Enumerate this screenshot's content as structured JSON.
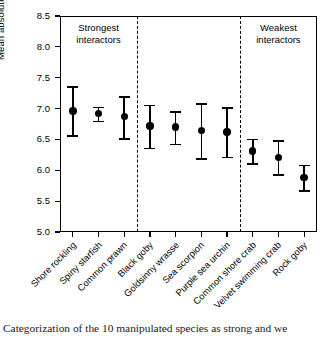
{
  "chart_data": {
    "type": "scatter",
    "title": "",
    "xlabel": "",
    "ylabel": "Mean absolute net effect (×10",
    "ylabel_exponent": "-3",
    "ylabel_close": ")",
    "ylim": [
      5.0,
      8.5
    ],
    "yticks": [
      "5.0",
      "5.5",
      "6.0",
      "6.5",
      "7.0",
      "7.5",
      "8.0",
      "8.5"
    ],
    "ytick_values": [
      5.0,
      5.5,
      6.0,
      6.5,
      7.0,
      7.5,
      8.0,
      8.5
    ],
    "grid": false,
    "legend": "none",
    "categories": [
      "Shore rockling",
      "Spiny starfish",
      "Common prawn",
      "Black goby",
      "Goldsinny wrasse",
      "Sea scorpion",
      "Purple sea urchin",
      "Common shore crab",
      "Velvet swimming crab",
      "Rock goby"
    ],
    "values": [
      6.96,
      6.92,
      6.87,
      6.72,
      6.7,
      6.64,
      6.62,
      6.31,
      6.21,
      5.88
    ],
    "error_low": [
      6.56,
      6.79,
      6.51,
      6.35,
      6.42,
      6.18,
      6.21,
      6.1,
      5.92,
      5.66
    ],
    "error_high": [
      7.35,
      7.02,
      7.19,
      7.05,
      6.94,
      7.07,
      7.01,
      6.5,
      6.47,
      6.08
    ],
    "annotations": [
      {
        "text_line1": "Strongest",
        "text_line2": "interactors",
        "center_category_index": 1
      },
      {
        "text_line1": "Weakest",
        "text_line2": "interactors",
        "center_category_index": 8
      }
    ],
    "dividers_after_category_index": [
      2,
      6
    ],
    "marker_color": "#000000",
    "axis_color": "#000000"
  },
  "caption": {
    "text": "Categorization of the 10 manipulated species as strong and we"
  }
}
